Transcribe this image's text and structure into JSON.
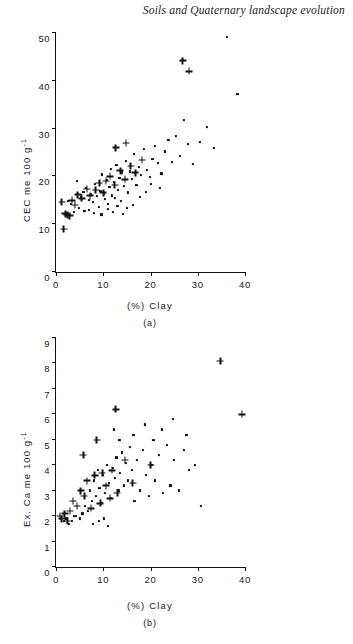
{
  "running_head": "Soils and Quaternary landscape evolution",
  "figure": {
    "panels": [
      {
        "id": "a",
        "caption": "(a)",
        "chart_data": {
          "type": "scatter",
          "title": "",
          "xlabel": "(%) Clay",
          "ylabel": "CEC me 100 g-1",
          "ylabel_base": "CEC me 100 g",
          "ylabel_exponent": "-1",
          "xlim": [
            0,
            40
          ],
          "ylim": [
            0,
            50
          ],
          "xticks": [
            0,
            10,
            20,
            30,
            40
          ],
          "yticks": [
            0,
            10,
            20,
            30,
            40,
            50
          ],
          "grid": false,
          "legend": "none",
          "series": [
            {
              "name": "dot-marker points",
              "marker": "dot",
              "points": [
                [
                  4.4,
                  19.0
                ],
                [
                  5.8,
                  16.8
                ],
                [
                  6.3,
                  17.6
                ],
                [
                  6.9,
                  15.0
                ],
                [
                  7.4,
                  16.2
                ],
                [
                  7.8,
                  14.6
                ],
                [
                  8.2,
                  18.4
                ],
                [
                  8.6,
                  15.8
                ],
                [
                  9.0,
                  13.6
                ],
                [
                  9.4,
                  17.0
                ],
                [
                  9.8,
                  20.4
                ],
                [
                  10.1,
                  16.4
                ],
                [
                  10.4,
                  15.2
                ],
                [
                  10.7,
                  19.2
                ],
                [
                  11.0,
                  14.2
                ],
                [
                  11.3,
                  17.8
                ],
                [
                  11.6,
                  21.6
                ],
                [
                  11.9,
                  16.0
                ],
                [
                  12.2,
                  18.8
                ],
                [
                  12.5,
                  15.4
                ],
                [
                  12.8,
                  22.4
                ],
                [
                  13.1,
                  17.2
                ],
                [
                  13.4,
                  19.6
                ],
                [
                  13.7,
                  14.8
                ],
                [
                  14.0,
                  20.8
                ],
                [
                  14.4,
                  18.0
                ],
                [
                  14.8,
                  23.2
                ],
                [
                  15.2,
                  16.6
                ],
                [
                  15.6,
                  21.0
                ],
                [
                  16.0,
                  19.4
                ],
                [
                  16.5,
                  24.6
                ],
                [
                  17.0,
                  18.2
                ],
                [
                  17.5,
                  22.0
                ],
                [
                  18.0,
                  20.2
                ],
                [
                  18.6,
                  25.8
                ],
                [
                  19.2,
                  21.4
                ],
                [
                  19.8,
                  19.8
                ],
                [
                  20.4,
                  23.6
                ],
                [
                  21.0,
                  26.4
                ],
                [
                  21.6,
                  22.8
                ],
                [
                  22.3,
                  20.6
                ],
                [
                  23.0,
                  25.2
                ],
                [
                  23.8,
                  27.6
                ],
                [
                  24.6,
                  23.0
                ],
                [
                  25.4,
                  28.4
                ],
                [
                  26.2,
                  24.2
                ],
                [
                  27.0,
                  31.8
                ],
                [
                  28.0,
                  26.8
                ],
                [
                  29.0,
                  22.6
                ],
                [
                  30.5,
                  27.2
                ],
                [
                  32.0,
                  30.4
                ],
                [
                  33.5,
                  26.0
                ],
                [
                  36.2,
                  49.2
                ],
                [
                  38.4,
                  37.2
                ],
                [
                  3.2,
                  14.2
                ],
                [
                  3.8,
                  12.6
                ],
                [
                  4.8,
                  13.4
                ],
                [
                  5.2,
                  15.6
                ],
                [
                  2.6,
                  14.8
                ],
                [
                  2.2,
                  12.2
                ],
                [
                  6.0,
                  12.8
                ],
                [
                  7.0,
                  13.0
                ],
                [
                  8.0,
                  12.4
                ],
                [
                  9.6,
                  12.0
                ],
                [
                  10.9,
                  13.2
                ],
                [
                  12.0,
                  12.6
                ],
                [
                  13.0,
                  13.8
                ],
                [
                  14.2,
                  12.2
                ],
                [
                  15.0,
                  13.4
                ],
                [
                  16.2,
                  14.0
                ],
                [
                  17.8,
                  15.6
                ],
                [
                  19.0,
                  16.8
                ],
                [
                  20.0,
                  18.4
                ],
                [
                  22.0,
                  17.6
                ]
              ]
            },
            {
              "name": "plus-marker points",
              "marker": "plus",
              "points": [
                [
                  1.2,
                  14.6
                ],
                [
                  1.6,
                  9.0
                ],
                [
                  2.0,
                  12.2
                ],
                [
                  2.4,
                  12.0
                ],
                [
                  2.9,
                  11.8
                ],
                [
                  3.4,
                  15.0
                ],
                [
                  4.0,
                  14.0
                ],
                [
                  4.6,
                  16.2
                ],
                [
                  5.4,
                  15.4
                ],
                [
                  6.6,
                  17.4
                ],
                [
                  7.2,
                  16.0
                ],
                [
                  8.4,
                  17.2
                ],
                [
                  9.2,
                  18.6
                ],
                [
                  10.0,
                  16.6
                ],
                [
                  10.6,
                  19.0
                ],
                [
                  11.4,
                  20.0
                ],
                [
                  12.4,
                  18.2
                ],
                [
                  13.6,
                  21.2
                ],
                [
                  14.6,
                  19.4
                ],
                [
                  15.8,
                  22.2
                ],
                [
                  16.8,
                  20.8
                ],
                [
                  18.2,
                  23.4
                ],
                [
                  12.6,
                  26.0
                ],
                [
                  14.8,
                  27.0
                ],
                [
                  26.8,
                  44.2
                ],
                [
                  28.2,
                  42.0
                ]
              ]
            }
          ]
        }
      },
      {
        "id": "b",
        "caption": "(b)",
        "chart_data": {
          "type": "scatter",
          "title": "",
          "xlabel": "(%) Clay",
          "ylabel": "Ex. Ca me 100 g-1",
          "ylabel_base": "Ex. Ca me 100 g",
          "ylabel_exponent": "-1",
          "xlim": [
            0,
            40
          ],
          "ylim": [
            0,
            9
          ],
          "xticks": [
            0,
            10,
            20,
            30,
            40
          ],
          "yticks": [
            0,
            1,
            2,
            3,
            4,
            5,
            6,
            7,
            8,
            9
          ],
          "grid": false,
          "legend": "none",
          "series": [
            {
              "name": "dot-marker points",
              "marker": "dot",
              "points": [
                [
                  4.2,
                  2.0
                ],
                [
                  5.0,
                  1.9
                ],
                [
                  5.6,
                  2.1
                ],
                [
                  6.2,
                  2.4
                ],
                [
                  6.8,
                  2.2
                ],
                [
                  7.2,
                  3.0
                ],
                [
                  7.6,
                  2.6
                ],
                [
                  8.0,
                  3.4
                ],
                [
                  8.4,
                  2.8
                ],
                [
                  8.8,
                  3.8
                ],
                [
                  9.2,
                  3.1
                ],
                [
                  9.6,
                  2.5
                ],
                [
                  10.0,
                  3.6
                ],
                [
                  10.4,
                  2.9
                ],
                [
                  10.8,
                  4.0
                ],
                [
                  11.2,
                  3.3
                ],
                [
                  11.6,
                  2.7
                ],
                [
                  12.0,
                  3.9
                ],
                [
                  12.4,
                  3.5
                ],
                [
                  12.8,
                  4.3
                ],
                [
                  13.2,
                  3.0
                ],
                [
                  13.6,
                  3.7
                ],
                [
                  14.0,
                  4.5
                ],
                [
                  14.4,
                  3.2
                ],
                [
                  14.8,
                  4.1
                ],
                [
                  15.2,
                  3.4
                ],
                [
                  15.6,
                  4.7
                ],
                [
                  16.0,
                  3.8
                ],
                [
                  16.6,
                  2.6
                ],
                [
                  17.2,
                  4.2
                ],
                [
                  17.8,
                  3.0
                ],
                [
                  18.4,
                  4.6
                ],
                [
                  19.0,
                  3.6
                ],
                [
                  19.6,
                  2.8
                ],
                [
                  20.2,
                  4.0
                ],
                [
                  21.0,
                  3.4
                ],
                [
                  21.8,
                  4.4
                ],
                [
                  22.6,
                  2.9
                ],
                [
                  23.4,
                  4.8
                ],
                [
                  24.2,
                  3.2
                ],
                [
                  25.0,
                  4.2
                ],
                [
                  26.0,
                  3.0
                ],
                [
                  27.0,
                  4.6
                ],
                [
                  28.2,
                  3.8
                ],
                [
                  29.4,
                  4.0
                ],
                [
                  30.6,
                  2.4
                ],
                [
                  12.2,
                  5.4
                ],
                [
                  13.4,
                  5.0
                ],
                [
                  16.4,
                  5.2
                ],
                [
                  18.8,
                  5.6
                ],
                [
                  20.6,
                  5.0
                ],
                [
                  22.4,
                  5.4
                ],
                [
                  24.8,
                  5.8
                ],
                [
                  27.6,
                  5.2
                ],
                [
                  11.0,
                  1.6
                ],
                [
                  3.4,
                  1.8
                ],
                [
                  3.8,
                  2.0
                ],
                [
                  2.8,
                  1.7
                ],
                [
                  2.2,
                  1.9
                ],
                [
                  1.6,
                  1.8
                ],
                [
                  9.0,
                  1.8
                ],
                [
                  10.2,
                  1.9
                ],
                [
                  7.8,
                  1.7
                ]
              ]
            },
            {
              "name": "plus-marker points",
              "marker": "plus",
              "points": [
                [
                  0.8,
                  2.0
                ],
                [
                  1.2,
                  1.9
                ],
                [
                  1.8,
                  2.1
                ],
                [
                  2.4,
                  1.8
                ],
                [
                  3.0,
                  2.2
                ],
                [
                  3.6,
                  2.6
                ],
                [
                  4.4,
                  2.4
                ],
                [
                  5.2,
                  3.0
                ],
                [
                  6.0,
                  2.8
                ],
                [
                  6.6,
                  3.4
                ],
                [
                  7.4,
                  2.3
                ],
                [
                  8.2,
                  3.6
                ],
                [
                  9.4,
                  2.5
                ],
                [
                  10.6,
                  3.2
                ],
                [
                  11.8,
                  3.8
                ],
                [
                  13.0,
                  2.9
                ],
                [
                  14.6,
                  4.2
                ],
                [
                  16.2,
                  3.3
                ],
                [
                  5.8,
                  4.4
                ],
                [
                  8.6,
                  5.0
                ],
                [
                  12.6,
                  6.2
                ],
                [
                  20.0,
                  4.0
                ],
                [
                  9.8,
                  3.7
                ],
                [
                  11.4,
                  2.7
                ],
                [
                  34.8,
                  8.1
                ],
                [
                  39.4,
                  6.0
                ]
              ]
            }
          ]
        }
      }
    ]
  }
}
